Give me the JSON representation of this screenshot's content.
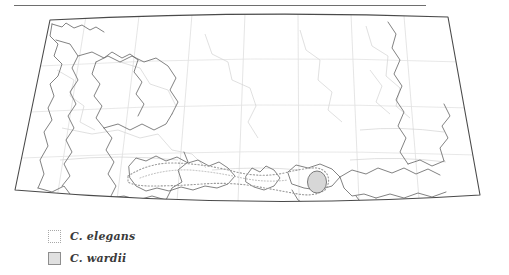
{
  "figure": {
    "top_rule": "horizontal-rule"
  },
  "map": {
    "projection": "conic",
    "frame_color": "#4a4a4a",
    "border_color": "#6b6b6b",
    "subborder_color": "#cfcfcf",
    "graticule_color": "#dcdcdc",
    "background": "#ffffff"
  },
  "distributions": [
    {
      "key": "elegans",
      "name": "C. elegans",
      "style": "dotted-outline",
      "outline_color": "#9a9a9a",
      "fill": "none"
    },
    {
      "key": "wardii",
      "name": "C. wardii",
      "style": "solid-outline-filled",
      "outline_color": "#7a7a7a",
      "fill": "#d7d7d7"
    }
  ],
  "legend": {
    "items": [
      {
        "label": "C. elegans",
        "swatch": "dotted-square-swatch"
      },
      {
        "label": "C. wardii",
        "swatch": "gray-square-swatch"
      }
    ]
  }
}
